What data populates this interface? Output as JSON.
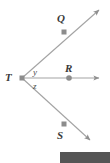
{
  "figure": {
    "background_color": "#ffffff",
    "line_color": "#9a9a9a",
    "marker_color": "#8c8c8c",
    "label_color": "#3a3a3a",
    "bar_color": "#555555"
  },
  "points": [
    {
      "id": "Q",
      "label": "Q",
      "marker": "square",
      "x": 64,
      "y": 32
    },
    {
      "id": "R",
      "label": "R",
      "marker": "circle",
      "x": 69,
      "y": 78
    },
    {
      "id": "S",
      "label": "S",
      "marker": "square",
      "x": 64,
      "y": 124
    },
    {
      "id": "T",
      "label": "T",
      "marker": "square",
      "x": 22,
      "y": 78
    }
  ],
  "angles": [
    {
      "id": "y",
      "label": "y",
      "between": "TQ and TR"
    },
    {
      "id": "z",
      "label": "z",
      "between": "TR and TS"
    }
  ],
  "rays": [
    {
      "id": "ray-TQ",
      "from": "T",
      "through": "Q",
      "arrow_end": {
        "x": 101,
        "y": 8
      }
    },
    {
      "id": "ray-TR",
      "from": "T",
      "through": "R",
      "arrow_end": {
        "x": 101,
        "y": 78
      }
    },
    {
      "id": "ray-TS",
      "from": "T",
      "through": "S",
      "arrow_end": {
        "x": 92,
        "y": 142
      }
    }
  ],
  "bottom_bar": {
    "name": "redaction-bar",
    "color": "#555555"
  }
}
